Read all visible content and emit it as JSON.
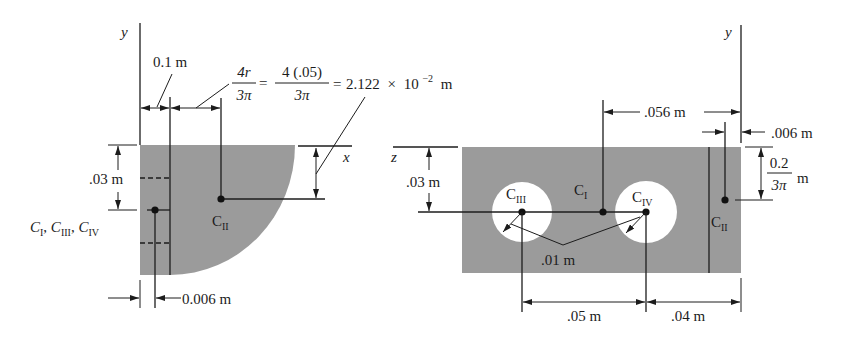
{
  "figure_left": {
    "axis_y": "y",
    "axis_x": "x",
    "dim_offset": "0.1 m",
    "formula": {
      "frac1_num": "4r",
      "frac1_den": "3π",
      "eq1": "=",
      "frac2_num": "4 (.05)",
      "frac2_den": "3π",
      "eq2": "=",
      "result_mantissa": "2.122",
      "result_times": "×",
      "result_base": "10",
      "result_exp": "−2",
      "result_unit": "m"
    },
    "dim_height": ".03 m",
    "centroids_label": [
      {
        "letter": "C",
        "sub": "I"
      },
      {
        "letter": "C",
        "sub": "III"
      },
      {
        "letter": "C",
        "sub": "IV"
      }
    ],
    "centroids_sep": ", ",
    "centroid_II": {
      "letter": "C",
      "sub": "II"
    },
    "dim_bottom": "0.006 m"
  },
  "figure_right": {
    "axis_y": "y",
    "axis_z": "z",
    "dim_top": ".056 m",
    "dim_small": ".006 m",
    "dim_frac": {
      "num": "0.2",
      "den": "3π",
      "unit": "m"
    },
    "dim_height": ".03 m",
    "dim_radius": ".01 m",
    "dim_spacing": ".05 m",
    "dim_edge": ".04 m",
    "centroid_I": {
      "letter": "C",
      "sub": "I"
    },
    "centroid_II": {
      "letter": "C",
      "sub": "II"
    },
    "centroid_III": {
      "letter": "C",
      "sub": "III"
    },
    "centroid_IV": {
      "letter": "C",
      "sub": "IV"
    }
  },
  "colors": {
    "fill": "#9b9b9b",
    "line": "#1c1c1c",
    "hole": "#ffffff",
    "background": "#ffffff"
  }
}
